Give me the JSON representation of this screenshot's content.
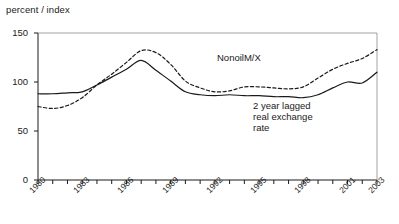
{
  "chart_data": {
    "type": "line",
    "title": "",
    "ylabel": "percent / index",
    "xlabel": "",
    "ylim": [
      0,
      150
    ],
    "yticks": [
      0,
      50,
      100,
      150
    ],
    "xlim": [
      1980,
      2003
    ],
    "grid": false,
    "legend_position": "inline-annotations",
    "x": [
      1980,
      1981,
      1982,
      1983,
      1984,
      1985,
      1986,
      1987,
      1988,
      1989,
      1990,
      1991,
      1992,
      1993,
      1994,
      1995,
      1996,
      1997,
      1998,
      1999,
      2000,
      2001,
      2002,
      2003
    ],
    "series": [
      {
        "name": "2 year lagged real exchange rate",
        "style": "solid",
        "color": "#1a1a1a",
        "values": [
          88,
          88,
          89,
          90,
          97,
          105,
          113,
          122,
          112,
          101,
          90,
          87,
          86,
          87,
          86,
          86,
          85,
          85,
          84,
          87,
          94,
          100,
          99,
          110
        ]
      },
      {
        "name": "NonoilM/X",
        "style": "dashed",
        "color": "#1a1a1a",
        "values": [
          75,
          73,
          76,
          84,
          97,
          108,
          120,
          132,
          130,
          118,
          101,
          94,
          90,
          91,
          95,
          95,
          94,
          93,
          95,
          104,
          113,
          119,
          124,
          133
        ]
      }
    ],
    "xtick_labels": [
      "1980",
      "1983",
      "1986",
      "1989",
      "1992",
      "1995",
      "1998",
      "2001",
      "2003"
    ],
    "annotations": [
      {
        "id": "nonoil",
        "text": "NonoilM/X",
        "x": 217,
        "y": 52
      },
      {
        "id": "rer-line1",
        "text": "2 year lagged",
        "x": 253,
        "y": 100
      },
      {
        "id": "rer-line2",
        "text": "real exchange",
        "x": 253,
        "y": 111
      },
      {
        "id": "rer-line3",
        "text": "rate",
        "x": 253,
        "y": 122
      }
    ]
  },
  "axis": {
    "header": "percent / index"
  }
}
